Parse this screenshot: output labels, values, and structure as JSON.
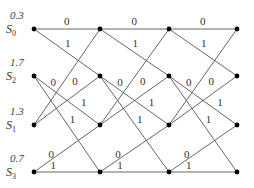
{
  "diagram": {
    "type": "trellis",
    "columns_x": [
      34,
      100,
      169,
      237
    ],
    "rows": [
      {
        "state": "S",
        "sub": "0",
        "metric": "0.3",
        "y": 29
      },
      {
        "state": "S",
        "sub": "2",
        "metric": "1.7",
        "y": 76
      },
      {
        "state": "S",
        "sub": "1",
        "metric": "1.3",
        "y": 125
      },
      {
        "state": "S",
        "sub": "3",
        "metric": "0.7",
        "y": 172
      }
    ],
    "transitions": [
      {
        "from": 0,
        "to": 0,
        "label": "0"
      },
      {
        "from": 0,
        "to": 1,
        "label": "1"
      },
      {
        "from": 2,
        "to": 0,
        "label": "0"
      },
      {
        "from": 2,
        "to": 1,
        "label": "1"
      },
      {
        "from": 1,
        "to": 2,
        "label": "0"
      },
      {
        "from": 1,
        "to": 3,
        "label": "1"
      },
      {
        "from": 3,
        "to": 2,
        "label": "0"
      },
      {
        "from": 3,
        "to": 3,
        "label": "1"
      }
    ],
    "colors": {
      "edge": "#555555",
      "node": "#000000",
      "text": "#333333"
    }
  }
}
